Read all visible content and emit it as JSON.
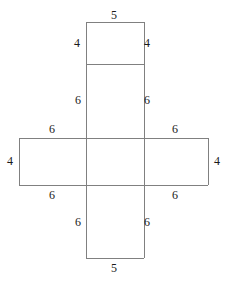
{
  "figure": {
    "name": "net-of-rectangular-prism",
    "shape": "cross",
    "background_color": "#ffffff",
    "stroke_color": "#808080",
    "stroke_width": 1,
    "text_color": "#1a1a1a",
    "canvas": {
      "width": 228,
      "height": 282
    }
  },
  "geometry": {
    "vertical_strip": {
      "left": 86,
      "right": 144,
      "top": 22,
      "bottom": 258
    },
    "horizontal_strip": {
      "left": 19,
      "right": 208,
      "top": 138,
      "bottom": 185
    },
    "top_divider_y": 64
  },
  "labels": [
    {
      "id": "top-edge-5",
      "text": "5",
      "x": 114,
      "y": 15,
      "edge": "top-square-top"
    },
    {
      "id": "top-square-left-4",
      "text": "4",
      "x": 77,
      "y": 43,
      "edge": "top-square-left"
    },
    {
      "id": "top-square-right-4",
      "text": "4",
      "x": 147,
      "y": 43,
      "edge": "top-square-right"
    },
    {
      "id": "upper-middle-left-6",
      "text": "6",
      "x": 78,
      "y": 100,
      "edge": "upper-vertical-left"
    },
    {
      "id": "upper-middle-right-6",
      "text": "6",
      "x": 147,
      "y": 100,
      "edge": "upper-vertical-right"
    },
    {
      "id": "band-top-left-6",
      "text": "6",
      "x": 52,
      "y": 129,
      "edge": "left-wing-top"
    },
    {
      "id": "band-top-right-6",
      "text": "6",
      "x": 175,
      "y": 129,
      "edge": "right-wing-top"
    },
    {
      "id": "band-left-4",
      "text": "4",
      "x": 10,
      "y": 161,
      "edge": "left-wing-left"
    },
    {
      "id": "band-right-4",
      "text": "4",
      "x": 217,
      "y": 161,
      "edge": "right-wing-right"
    },
    {
      "id": "band-bottom-left-6",
      "text": "6",
      "x": 52,
      "y": 195,
      "edge": "left-wing-bottom"
    },
    {
      "id": "band-bottom-right-6",
      "text": "6",
      "x": 175,
      "y": 195,
      "edge": "right-wing-bottom"
    },
    {
      "id": "lower-middle-left-6",
      "text": "6",
      "x": 78,
      "y": 222,
      "edge": "lower-vertical-left"
    },
    {
      "id": "lower-middle-right-6",
      "text": "6",
      "x": 147,
      "y": 222,
      "edge": "lower-vertical-right"
    },
    {
      "id": "bottom-edge-5",
      "text": "5",
      "x": 114,
      "y": 268,
      "edge": "bottom-square-bottom"
    }
  ],
  "segments": [
    {
      "id": "vertical-strip-left",
      "x1": 86,
      "y1": 22,
      "x2": 86,
      "y2": 258
    },
    {
      "id": "vertical-strip-right",
      "x1": 144,
      "y1": 22,
      "x2": 144,
      "y2": 258
    },
    {
      "id": "vertical-strip-top",
      "x1": 86,
      "y1": 22,
      "x2": 144,
      "y2": 22
    },
    {
      "id": "vertical-strip-bottom",
      "x1": 86,
      "y1": 258,
      "x2": 144,
      "y2": 258
    },
    {
      "id": "top-square-divider",
      "x1": 86,
      "y1": 64,
      "x2": 144,
      "y2": 64
    },
    {
      "id": "horizontal-strip-left",
      "x1": 19,
      "y1": 138,
      "x2": 19,
      "y2": 185
    },
    {
      "id": "horizontal-strip-right",
      "x1": 208,
      "y1": 138,
      "x2": 208,
      "y2": 185
    },
    {
      "id": "horizontal-strip-top",
      "x1": 19,
      "y1": 138,
      "x2": 208,
      "y2": 138
    },
    {
      "id": "horizontal-strip-bottom",
      "x1": 19,
      "y1": 185,
      "x2": 208,
      "y2": 185
    }
  ]
}
